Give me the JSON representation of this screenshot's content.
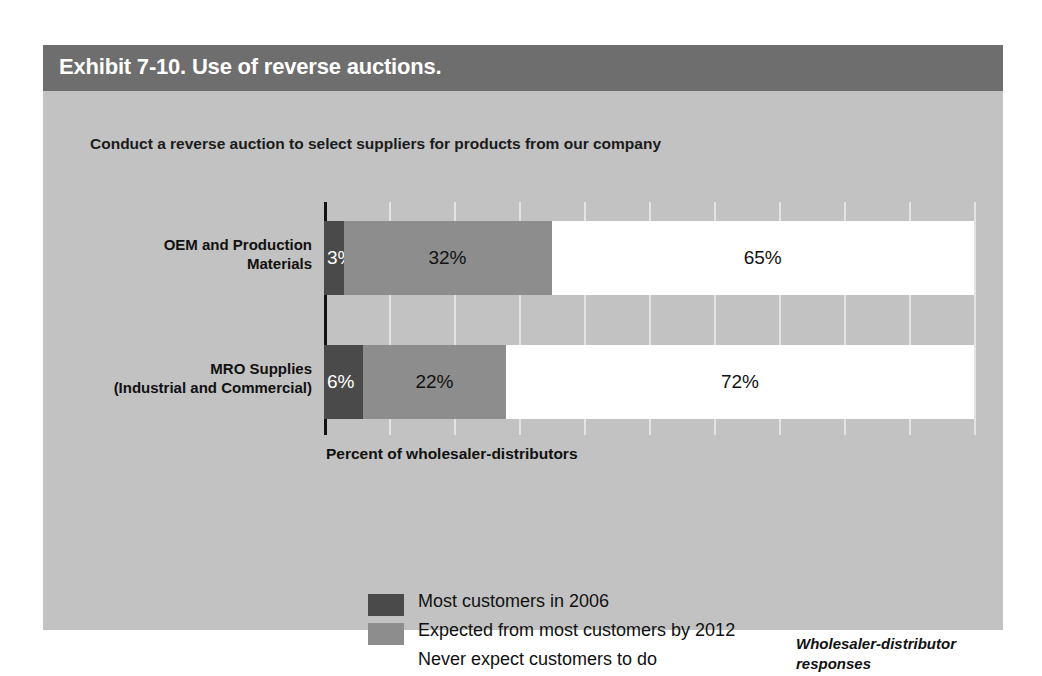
{
  "exhibit": {
    "title": "Exhibit 7-10. Use of reverse auctions.",
    "subtitle": "Conduct a reverse auction to select suppliers for products from our company",
    "note": "Wholesaler-distributor responses",
    "colors": {
      "title_band": "#6e6e6e",
      "panel": "#c2c2c2",
      "series_1": "#4a4a4a",
      "series_2": "#8d8d8d",
      "series_3": "#ffffff"
    }
  },
  "chart_data": {
    "type": "bar",
    "orientation": "horizontal",
    "stacked": true,
    "title": "Conduct a reverse auction to select suppliers for products from our company",
    "xlabel": "Percent of wholesaler-distributors",
    "ylabel": "",
    "xlim": [
      0,
      100
    ],
    "grid": true,
    "xticks": [
      0,
      10,
      20,
      30,
      40,
      50,
      60,
      70,
      80,
      90,
      100
    ],
    "legend_position": "bottom-left",
    "categories": [
      "OEM and Production Materials",
      "MRO Supplies (Industrial and Commercial)"
    ],
    "category_lines": [
      [
        "OEM and Production",
        "Materials"
      ],
      [
        "MRO Supplies",
        "(Industrial and Commercial)"
      ]
    ],
    "series": [
      {
        "name": "Most customers in 2006",
        "values": [
          3,
          6
        ],
        "labels": [
          "3%",
          "6%"
        ]
      },
      {
        "name": "Expected from most customers by 2012",
        "values": [
          32,
          22
        ],
        "labels": [
          "32%",
          "22%"
        ]
      },
      {
        "name": "Never expect customers to do",
        "values": [
          65,
          72
        ],
        "labels": [
          "65%",
          "72%"
        ]
      }
    ]
  }
}
